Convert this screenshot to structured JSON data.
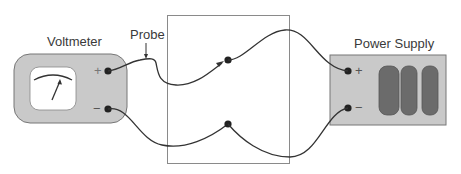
{
  "diagram": {
    "voltmeter": {
      "label": "Voltmeter",
      "plus_sign": "+",
      "minus_sign": "−",
      "icon": "analog-meter-icon"
    },
    "probe": {
      "label": "Probe"
    },
    "power_supply": {
      "label": "Power Supply",
      "plus_sign": "+",
      "minus_sign": "−",
      "cells": 3,
      "icon": "battery-cells-icon"
    },
    "colors": {
      "body_fill": "#c9c9c9",
      "cell_fill": "#6b6b6b",
      "wire": "#333333",
      "box_border": "#8a8a8a",
      "text": "#3a3a3a"
    }
  }
}
